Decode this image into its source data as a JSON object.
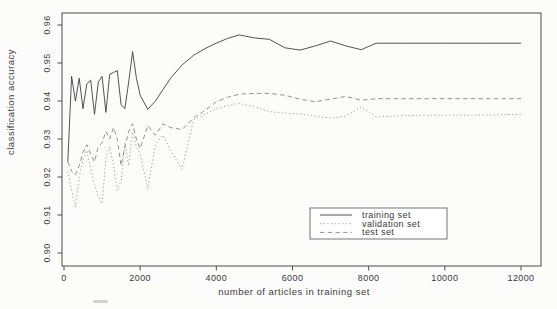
{
  "figure": {
    "background": "#fcfcfb",
    "axis_color": "#4d4d4d",
    "text_color": "#3a3a3a"
  },
  "chart_data": {
    "type": "line",
    "title": "",
    "xlabel": "number of articles in training set",
    "ylabel": "classification accuracy",
    "xlim": [
      0,
      12000
    ],
    "ylim": [
      0.9,
      0.96
    ],
    "grid": false,
    "legend_position": "inside-bottom-center",
    "x_ticks": [
      0,
      2000,
      4000,
      6000,
      8000,
      10000,
      12000
    ],
    "x_tick_labels": [
      "0",
      "2000",
      "4000",
      "6000",
      "8000",
      "10000",
      "12000"
    ],
    "y_ticks": [
      0.9,
      0.91,
      0.92,
      0.93,
      0.94,
      0.95,
      0.96
    ],
    "y_tick_labels": [
      "0.90",
      "0.91",
      "0.92",
      "0.93",
      "0.94",
      "0.95",
      "0.96"
    ],
    "x": [
      100,
      200,
      300,
      400,
      500,
      600,
      700,
      800,
      900,
      1000,
      1100,
      1200,
      1300,
      1400,
      1500,
      1600,
      1700,
      1800,
      1900,
      2000,
      2200,
      2400,
      2600,
      2800,
      3100,
      3400,
      3700,
      4000,
      4300,
      4600,
      5000,
      5400,
      5800,
      6200,
      6600,
      7000,
      7400,
      7800,
      8200,
      9000,
      10000,
      11000,
      12000
    ],
    "series": [
      {
        "name": "training set",
        "style": "solid",
        "color": "#3f3f3f",
        "values": [
          0.924,
          0.9465,
          0.94,
          0.946,
          0.938,
          0.9445,
          0.9455,
          0.9365,
          0.945,
          0.9465,
          0.937,
          0.947,
          0.9475,
          0.948,
          0.939,
          0.938,
          0.945,
          0.953,
          0.946,
          0.9415,
          0.9378,
          0.94,
          0.943,
          0.946,
          0.9495,
          0.952,
          0.9538,
          0.9552,
          0.9565,
          0.9574,
          0.9566,
          0.9562,
          0.954,
          0.9534,
          0.9545,
          0.9558,
          0.9545,
          0.9535,
          0.9552,
          0.9552,
          0.9552,
          0.9552,
          0.9552
        ]
      },
      {
        "name": "validation set",
        "style": "dotted",
        "color": "#9b9b9b",
        "values": [
          0.9215,
          0.9165,
          0.912,
          0.92,
          0.9245,
          0.927,
          0.922,
          0.918,
          0.915,
          0.913,
          0.925,
          0.928,
          0.923,
          0.9166,
          0.919,
          0.929,
          0.923,
          0.9318,
          0.928,
          0.926,
          0.917,
          0.9285,
          0.931,
          0.927,
          0.922,
          0.935,
          0.9365,
          0.938,
          0.9388,
          0.9394,
          0.9385,
          0.9372,
          0.9368,
          0.9366,
          0.936,
          0.9355,
          0.936,
          0.9385,
          0.9358,
          0.9362,
          0.9363,
          0.9363,
          0.9365
        ]
      },
      {
        "name": "test set",
        "style": "dashed",
        "color": "#878787",
        "values": [
          0.924,
          0.9215,
          0.9205,
          0.923,
          0.9265,
          0.9285,
          0.926,
          0.924,
          0.928,
          0.929,
          0.932,
          0.93,
          0.933,
          0.93,
          0.923,
          0.928,
          0.932,
          0.934,
          0.93,
          0.9275,
          0.9335,
          0.931,
          0.934,
          0.933,
          0.9325,
          0.9355,
          0.9375,
          0.9398,
          0.941,
          0.9418,
          0.942,
          0.942,
          0.9415,
          0.9405,
          0.9398,
          0.9405,
          0.9412,
          0.9402,
          0.9406,
          0.9406,
          0.9406,
          0.9406,
          0.9406
        ]
      }
    ]
  }
}
